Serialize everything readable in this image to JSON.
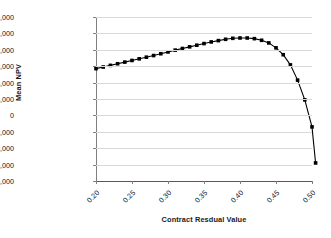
{
  "chart_data": {
    "type": "line",
    "title": "",
    "subtitle": "",
    "xlabel": "Contract Resdual Value",
    "ylabel": "Mean NPV",
    "xlim": [
      0.2,
      0.5
    ],
    "ylim": [
      -4000000,
      6000000
    ],
    "grid": true,
    "legend": "none",
    "marker": "square",
    "line_color": "#000000",
    "marker_color": "#000000",
    "grid_color": "#d9d9d9",
    "y_ticks": [
      6000000,
      5000000,
      4000000,
      3000000,
      2000000,
      1000000,
      0,
      -1000000,
      -2000000,
      -3000000,
      -4000000
    ],
    "y_tick_labels": [
      "6,000,000",
      "5,000,000",
      "4,000,000",
      "3,000,000",
      "2,000,000",
      "1,000,000",
      "0",
      "-1,000,000",
      "-2,000,000",
      "-3,000,000",
      "-4,000,000"
    ],
    "x_ticks": [
      0.2,
      0.25,
      0.3,
      0.35,
      0.4,
      0.45,
      0.5
    ],
    "x_tick_labels": [
      "0.20",
      "0.25",
      "0.30",
      "0.35",
      "0.40",
      "0.45",
      "0.50"
    ],
    "series": [
      {
        "name": "Mean NPV",
        "x": [
          0.2,
          0.21,
          0.22,
          0.23,
          0.24,
          0.25,
          0.26,
          0.27,
          0.28,
          0.29,
          0.3,
          0.31,
          0.32,
          0.33,
          0.34,
          0.35,
          0.36,
          0.37,
          0.38,
          0.39,
          0.4,
          0.41,
          0.42,
          0.43,
          0.44,
          0.45,
          0.46,
          0.47,
          0.48,
          0.49,
          0.5
        ],
        "values": [
          2850000,
          2950000,
          3050000,
          3150000,
          3250000,
          3350000,
          3450000,
          3550000,
          3650000,
          3760000,
          3870000,
          3980000,
          4080000,
          4180000,
          4280000,
          4380000,
          4480000,
          4560000,
          4640000,
          4700000,
          4720000,
          4720000,
          4680000,
          4580000,
          4420000,
          4120000,
          3700000,
          3080000,
          2150000,
          950000,
          -700000
        ],
        "values_note": "last point -2,900,000 at x=0.505",
        "extra_points": [
          {
            "x": 0.505,
            "y": -2900000
          }
        ]
      }
    ]
  },
  "axis": {
    "y_title": "Mean NPV",
    "x_title": "Contract Resdual Value"
  }
}
